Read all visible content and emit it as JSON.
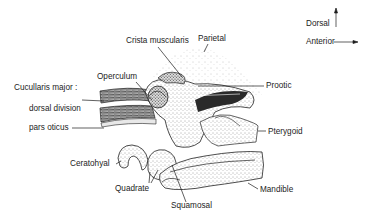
{
  "diagram": {
    "orientation": {
      "dorsal": "Dorsal",
      "anterior": "Anterior"
    },
    "labels": {
      "crista_muscularis": "Crista muscularis",
      "parietal": "Parietal",
      "operculum": "Operculum",
      "cucullaris_major": "Cucullaris major :",
      "dorsal_division": "dorsal division",
      "pars_oticus": "pars oticus",
      "prootic": "Prootic",
      "pterygoid": "Pterygoid",
      "ceratohyal": "Ceratohyal",
      "quadrate": "Quadrate",
      "squamosal": "Squamosal",
      "mandible": "Mandible"
    },
    "colors": {
      "ink": "#1c1c1c",
      "stipple": "#555555",
      "background": "#ffffff"
    }
  }
}
